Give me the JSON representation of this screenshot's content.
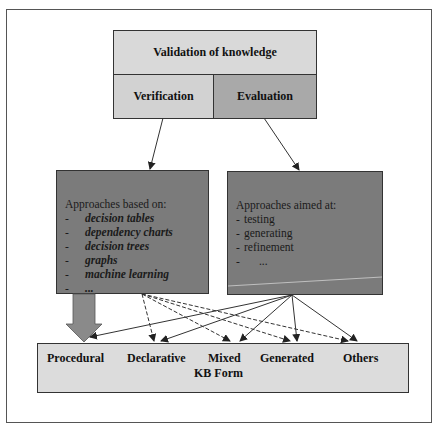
{
  "diagram": {
    "top": {
      "title": "Validation of knowledge",
      "left_label": "Verification",
      "right_label": "Evaluation"
    },
    "left_approach": {
      "heading": "Approaches based on:",
      "items": [
        {
          "dash": "-",
          "text": "decision tables"
        },
        {
          "dash": "-",
          "text": "dependency charts"
        },
        {
          "dash": "-",
          "text": "decision trees"
        },
        {
          "dash": "-",
          "text": "graphs"
        },
        {
          "dash": "-",
          "text": "machine learning"
        },
        {
          "dash": "-",
          "text": "..."
        }
      ]
    },
    "right_approach": {
      "heading": "Approaches aimed at:",
      "items": [
        {
          "dash": "-",
          "text": "testing"
        },
        {
          "dash": "-",
          "text": "generating"
        },
        {
          "dash": "-",
          "text": "refinement"
        },
        {
          "dash": "-",
          "text": "  ..."
        }
      ]
    },
    "kb_forms": {
      "labels": [
        "Procedural",
        "Declarative",
        "Mixed",
        "Generated",
        "Others"
      ],
      "caption": "KB Form"
    },
    "colors": {
      "validation": "#d9d9d9",
      "verification": "#d2d2d2",
      "evaluation": "#a9a9a9",
      "approach_box": "#7b7b7b",
      "kb_box": "#dcdcdc"
    }
  }
}
